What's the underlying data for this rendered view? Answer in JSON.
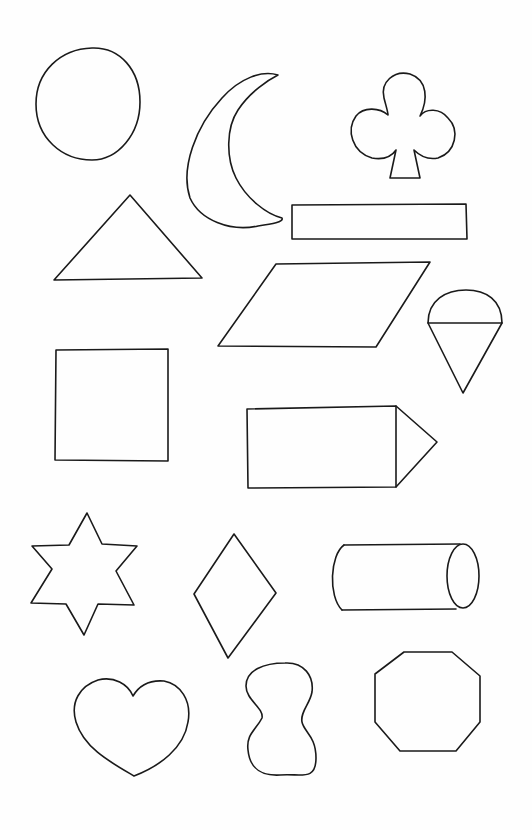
{
  "page": {
    "title": "Shapes worksheet",
    "background_color": "#fefefe",
    "stroke_color": "#1a1a1a"
  },
  "shapes": [
    {
      "id": "circle",
      "label": "circle"
    },
    {
      "id": "crescent",
      "label": "crescent moon"
    },
    {
      "id": "club",
      "label": "club"
    },
    {
      "id": "triangle",
      "label": "triangle"
    },
    {
      "id": "rectangle",
      "label": "long rectangle"
    },
    {
      "id": "parallelogram",
      "label": "parallelogram"
    },
    {
      "id": "ice-cream-cone",
      "label": "ice cream cone"
    },
    {
      "id": "square",
      "label": "square"
    },
    {
      "id": "pencil",
      "label": "pencil / pentagon arrow"
    },
    {
      "id": "star",
      "label": "six-point star"
    },
    {
      "id": "diamond",
      "label": "diamond"
    },
    {
      "id": "cylinder",
      "label": "cylinder"
    },
    {
      "id": "heart",
      "label": "heart"
    },
    {
      "id": "figure-eight",
      "label": "figure eight / peanut"
    },
    {
      "id": "octagon",
      "label": "octagon"
    }
  ]
}
